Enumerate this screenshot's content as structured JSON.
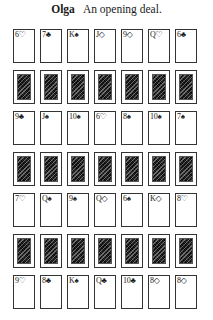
{
  "caption": {
    "name": "Olga",
    "text": "An opening deal."
  },
  "layout": {
    "columns": 7,
    "rows": 7,
    "column_pitch_px": 27,
    "row_pitch_px": 41
  },
  "rows": [
    {
      "type": "face",
      "cards": [
        "6♡",
        "7♣",
        "K♠",
        "J◇",
        "9◇",
        "Q♡",
        "6♣"
      ]
    },
    {
      "type": "back",
      "cards": [
        "",
        "",
        "",
        "",
        "",
        "",
        ""
      ]
    },
    {
      "type": "face",
      "cards": [
        "9♣",
        "J♠",
        "10♠",
        "6♡",
        "8♠",
        "10♠",
        "7♠"
      ]
    },
    {
      "type": "back",
      "cards": [
        "",
        "",
        "",
        "",
        "",
        "",
        ""
      ]
    },
    {
      "type": "face",
      "cards": [
        "7♡",
        "Q♠",
        "9♠",
        "Q◇",
        "6♠",
        "K◇",
        "8♡"
      ]
    },
    {
      "type": "back",
      "cards": [
        "",
        "",
        "",
        "",
        "",
        "",
        ""
      ]
    },
    {
      "type": "face",
      "cards": [
        "9♡",
        "8♣",
        "K♠",
        "Q♣",
        "10♣",
        "8◇",
        "8◇"
      ]
    }
  ]
}
